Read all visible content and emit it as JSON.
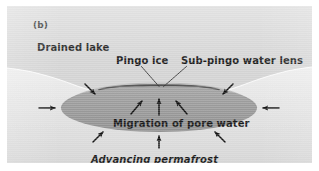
{
  "figure": {
    "panel_label": "(b)",
    "type": "cross-section diagram"
  },
  "labels": {
    "drained_lake": "Drained lake",
    "pingo_ice": "Pingo ice",
    "sub_pingo_water_lens": "Sub-pingo water lens",
    "migration_of_pore_water": "Migration of pore water",
    "advancing_permafrost": "Advancing permafrost"
  },
  "colors": {
    "panel_background": "#d4d4d4",
    "lens_fill": "#9e9e9e",
    "pingo_ice_cap": "#4a4a4a",
    "ground_surface": "#eaeaea",
    "text": "#1a1a1a",
    "arrow": "#111111",
    "leader_line": "#333333"
  },
  "geometry": {
    "lens": {
      "center_x": 152,
      "center_y": 102,
      "radius_x": 98,
      "radius_y": 24
    },
    "ground_surface_note": "pale basin of drained lake dipping toward centre"
  },
  "arrows": {
    "inward_permafrost": [
      {
        "name": "left-horizontal",
        "direction": "right"
      },
      {
        "name": "right-horizontal",
        "direction": "left"
      },
      {
        "name": "upper-left-diagonal",
        "direction": "down-right"
      },
      {
        "name": "upper-right-diagonal",
        "direction": "down-left"
      },
      {
        "name": "lower-left-diagonal",
        "direction": "up-right"
      },
      {
        "name": "lower-right-diagonal",
        "direction": "up-left"
      },
      {
        "name": "bottom-vertical",
        "direction": "up"
      }
    ],
    "pore_water_migration": [
      {
        "name": "inner-left-diagonal",
        "direction": "up-right"
      },
      {
        "name": "inner-center-vertical",
        "direction": "up"
      },
      {
        "name": "inner-right-diagonal",
        "direction": "up-left"
      }
    ]
  }
}
